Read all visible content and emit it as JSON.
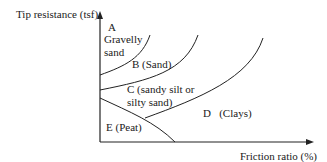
{
  "diagram": {
    "type": "soil-classification-chart",
    "y_axis_label": "Tip resistance (tsf)",
    "x_axis_label": "Friction ratio (%)",
    "zones": {
      "A_line1": "A",
      "A_line2": "Gravelly",
      "A_line3": "sand",
      "B": "B (Sand)",
      "C_line1": "C (sandy silt or",
      "C_line2": "silty sand)",
      "D": "D   (Clays)",
      "E": "E (Peat)"
    },
    "colors": {
      "line": "#222222",
      "background": "#ffffff"
    }
  }
}
